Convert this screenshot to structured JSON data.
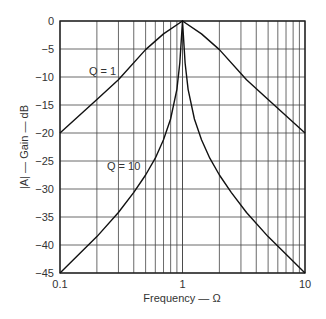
{
  "chart_data": {
    "type": "line",
    "title": "",
    "xlabel": "Frequency — Ω",
    "ylabel": "|A| — Gain — dB",
    "xscale": "log",
    "xlim": [
      0.1,
      10
    ],
    "ylim": [
      -45,
      0
    ],
    "x_ticks": [
      "0.1",
      "1",
      "10"
    ],
    "y_ticks": [
      "0",
      "-5",
      "-10",
      "-15",
      "-20",
      "-25",
      "-30",
      "-35",
      "-40",
      "-45"
    ],
    "grid": true,
    "legend": "inline annotations",
    "series": [
      {
        "name": "Q = 1",
        "x": [
          0.1,
          0.2,
          0.3,
          0.5,
          0.7,
          1,
          1.43,
          2,
          3.33,
          5,
          10
        ],
        "y": [
          -20,
          -14,
          -10.5,
          -5.1,
          -2.3,
          0,
          -2.3,
          -5.1,
          -10.5,
          -14,
          -20
        ]
      },
      {
        "name": "Q = 10",
        "x": [
          0.1,
          0.2,
          0.3,
          0.4,
          0.5,
          0.6,
          0.7,
          0.8,
          0.9,
          0.95,
          1,
          1.05,
          1.11,
          1.25,
          1.43,
          1.67,
          2,
          2.5,
          3.33,
          5,
          10
        ],
        "y": [
          -45,
          -38.5,
          -34.2,
          -30.6,
          -27.5,
          -24.5,
          -21.2,
          -17.5,
          -12.2,
          -7.5,
          0,
          -7.5,
          -12.2,
          -17.5,
          -21.2,
          -24.5,
          -27.5,
          -30.6,
          -34.2,
          -38.5,
          -45
        ]
      }
    ],
    "annotations": [
      {
        "text": "Q = 1",
        "x": 0.2,
        "y": -10
      },
      {
        "text": "Q = 10",
        "x": 0.39,
        "y": -22
      }
    ]
  },
  "labels": {
    "xlabel": "Frequency — Ω",
    "ylabel": "|A| — Gain — dB",
    "q1": "Q = 1",
    "q10": "Q = 10"
  }
}
